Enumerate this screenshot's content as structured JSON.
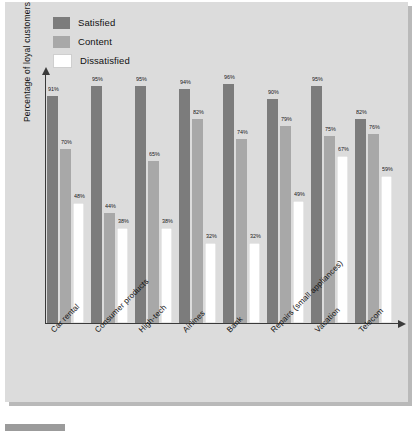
{
  "chart_data": {
    "type": "bar",
    "title": "",
    "xlabel": "",
    "ylabel": "Percentage of loyal customers",
    "ylim": [
      0,
      100
    ],
    "grid": false,
    "legend_position": "top-left",
    "categories": [
      "Car rental",
      "Consumer products",
      "High-tech",
      "Airlines",
      "Bank",
      "Repairs (small appliances)",
      "Vacation",
      "Telecom"
    ],
    "series": [
      {
        "name": "Satisfied",
        "color": "#7c7c7c",
        "values": [
          91,
          95,
          95,
          94,
          96,
          90,
          95,
          82
        ],
        "labels": [
          "91%",
          "95%",
          "95%",
          "94%",
          "96%",
          "90%",
          "95%",
          "82%"
        ]
      },
      {
        "name": "Content",
        "color": "#a8a8a8",
        "values": [
          70,
          44,
          65,
          82,
          74,
          79,
          75,
          76
        ],
        "labels": [
          "70%",
          "44%",
          "65%",
          "82%",
          "74%",
          "79%",
          "75%",
          "76%"
        ]
      },
      {
        "name": "Dissatisfied",
        "color": "#ffffff",
        "values": [
          48,
          38,
          38,
          32,
          32,
          49,
          67,
          59
        ],
        "labels": [
          "48%",
          "38%",
          "38%",
          "32%",
          "32%",
          "49%",
          "67%",
          "59%"
        ]
      }
    ]
  },
  "legend": {
    "items": [
      {
        "label": "Satisfied",
        "color": "#7c7c7c"
      },
      {
        "label": "Content",
        "color": "#a8a8a8"
      },
      {
        "label": "Dissatisfied",
        "color": "#ffffff"
      }
    ]
  },
  "axes": {
    "y_title": "Percentage of loyal customers"
  },
  "colors": {
    "background": "#dcdcdc",
    "page": "#ffffff",
    "axis": "#3a3a3a",
    "satisfied": "#7c7c7c",
    "content": "#a8a8a8",
    "dissatisfied": "#ffffff",
    "shadow": "#b9b9b9",
    "caption_bar": "#9b9b9b"
  }
}
